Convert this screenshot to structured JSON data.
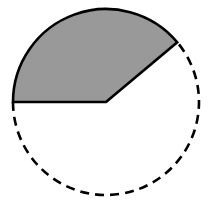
{
  "diagram": {
    "type": "circle-sector",
    "center": [
      106,
      102
    ],
    "radius": 93,
    "sector": {
      "start_angle_deg": 40,
      "end_angle_deg": 180,
      "fill": "#999999",
      "stroke": "#000000"
    },
    "remaining_arc": {
      "style": "dashed",
      "stroke": "#000000"
    },
    "background": "#ffffff"
  }
}
